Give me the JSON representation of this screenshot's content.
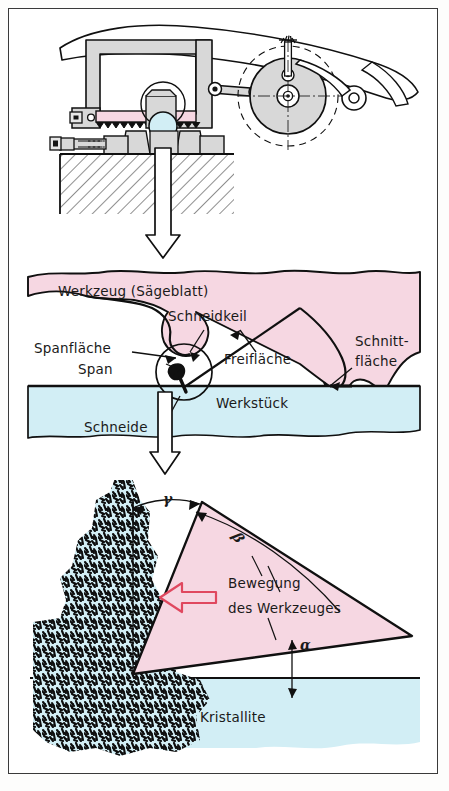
{
  "figure": {
    "language": "de",
    "colors": {
      "tool_pink": "#f6d7e2",
      "workpiece_blue": "#d2eef5",
      "machine_gray": "#d8d8d8",
      "outline": "#101010",
      "arrow_red": "#e0485f",
      "frame": "#3a3a3a",
      "page": "#ffffff"
    }
  },
  "panels": {
    "top": {
      "name": "saw-machine-assembly",
      "caption": "",
      "parts": {
        "saw_frame": "Sägebügel",
        "saw_blade": "Sägeblatt",
        "workpiece": "Werkstück",
        "vise": "Schraubstock",
        "crank_disc": "Kurbelscheibe",
        "connecting_rod": "Pleuelstange",
        "machine_bed": "Maschinenbett"
      }
    },
    "middle": {
      "name": "cutting-zone-detail",
      "labels": {
        "tool": "Werkzeug (Sägeblatt)",
        "cutting_wedge": "Schneidkeil",
        "rake_face": "Spanfläche",
        "chip": "Span",
        "flank_face": "Freifläche",
        "cut_surface_line1": "Schnitt-",
        "cut_surface_line2": "fläche",
        "cutting_edge": "Schneide",
        "workpiece": "Werkstück"
      }
    },
    "bottom": {
      "name": "cutting-wedge-angles",
      "labels": {
        "motion_line1": "Bewegung",
        "motion_line2": "des  Werkzeuges",
        "crystallites": "Kristallite"
      },
      "angles": [
        {
          "symbol": "γ",
          "name": "rake-angle",
          "german": "Spanwinkel"
        },
        {
          "symbol": "β",
          "name": "wedge-angle",
          "german": "Keilwinkel"
        },
        {
          "symbol": "α",
          "name": "clearance-angle",
          "german": "Freiwinkel"
        }
      ]
    }
  },
  "flow_arrows": [
    {
      "name": "detail-arrow-top",
      "direction": "down"
    },
    {
      "name": "detail-arrow-middle",
      "direction": "down"
    }
  ],
  "motion_arrow": {
    "name": "tool-motion-arrow",
    "direction": "left"
  }
}
